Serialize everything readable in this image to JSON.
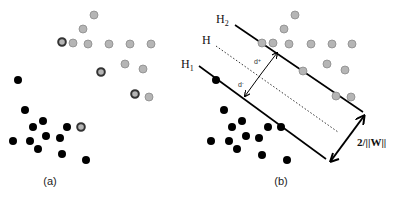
{
  "panels": [
    {
      "id": "a",
      "caption": "(a)",
      "class_gray_points": [
        [
          94,
          15
        ],
        [
          83,
          29
        ],
        [
          73,
          43
        ],
        [
          88,
          44
        ],
        [
          109,
          44
        ],
        [
          130,
          44
        ],
        [
          151,
          44
        ],
        [
          125,
          64
        ],
        [
          143,
          69
        ],
        [
          149,
          97
        ]
      ],
      "support_vector_rings": [
        [
          62,
          42
        ],
        [
          101,
          72
        ],
        [
          135,
          94
        ],
        [
          81,
          127
        ]
      ],
      "class_black_points": [
        [
          18,
          80
        ],
        [
          25,
          110
        ],
        [
          43,
          121
        ],
        [
          33,
          127
        ],
        [
          67,
          127
        ],
        [
          13,
          141
        ],
        [
          30,
          141
        ],
        [
          46,
          136
        ],
        [
          60,
          138
        ],
        [
          38,
          149
        ],
        [
          62,
          154
        ],
        [
          86,
          160
        ]
      ]
    },
    {
      "id": "b",
      "caption": "(b)",
      "hyperplanes": [
        {
          "label": "H",
          "sub": "2",
          "style": "solid"
        },
        {
          "label": "H",
          "sub": "",
          "style": "dotted"
        },
        {
          "label": "H",
          "sub": "1",
          "style": "solid"
        }
      ],
      "distance_labels": {
        "d_plus": "d+",
        "d_minus": "d-"
      },
      "margin_label": "2/||W||",
      "class_gray_points": [
        [
          295,
          15
        ],
        [
          284,
          29
        ],
        [
          262,
          43
        ],
        [
          273,
          43
        ],
        [
          289,
          44
        ],
        [
          311,
          44
        ],
        [
          332,
          44
        ],
        [
          352,
          44
        ],
        [
          327,
          64
        ],
        [
          345,
          70
        ],
        [
          303,
          71
        ],
        [
          336,
          96
        ],
        [
          351,
          97
        ]
      ],
      "class_black_points": [
        [
          216,
          80
        ],
        [
          224,
          110
        ],
        [
          242,
          121
        ],
        [
          232,
          127
        ],
        [
          268,
          127
        ],
        [
          281,
          127
        ],
        [
          211,
          141
        ],
        [
          229,
          141
        ],
        [
          246,
          136
        ],
        [
          259,
          138
        ],
        [
          237,
          149
        ],
        [
          262,
          155
        ],
        [
          287,
          160
        ]
      ]
    }
  ],
  "colors": {
    "gray_fill": "#b5b5b5",
    "gray_stroke": "#8a8a8a",
    "black": "#000000",
    "ring": "#333333"
  }
}
